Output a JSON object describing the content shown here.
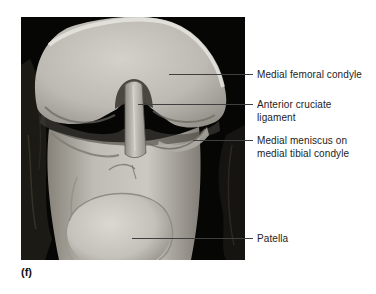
{
  "figure_marker": "(f)",
  "photo": {
    "content": "dissected knee joint specimen photograph, anterior flexed view",
    "background": "#060604"
  },
  "labels": [
    {
      "name": "medial-femoral-condyle",
      "lines": [
        "Medial femoral condyle"
      ]
    },
    {
      "name": "anterior-cruciate-ligament",
      "lines": [
        "Anterior cruciate",
        "ligament"
      ]
    },
    {
      "name": "medial-meniscus-on-medial-tibial-condyle",
      "lines": [
        "Medial meniscus on",
        "medial tibial condyle"
      ]
    },
    {
      "name": "patella",
      "lines": [
        "Patella"
      ]
    }
  ],
  "colors": {
    "page_background": "#ffffff",
    "photo_background": "#060604",
    "bone_light": "#d8d5cf",
    "bone_mid": "#b3b0aa",
    "bone_shadow": "#7c7974",
    "tissue_dark": "#181712",
    "leader_line": "#3f3f3f",
    "label_text": "#1c1c1c"
  }
}
